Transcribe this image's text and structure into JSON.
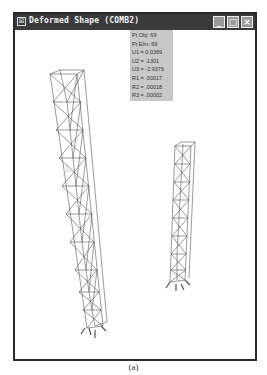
{
  "window": {
    "title": "Deformed Shape (COMB2)",
    "controls": {
      "minimize": "_",
      "maximize": "□",
      "close": "×"
    }
  },
  "point_info": {
    "lines": [
      "Pt Obj: 69",
      "Pt Elm: 69",
      "U1 = 0.0369",
      "U2 = .1301",
      "U3 = -2.9376",
      "R1 = .00017",
      "R2 = .00018",
      "R3 = .00002"
    ]
  },
  "caption": "(a)",
  "colors": {
    "titlebar": "#3a3a3a",
    "info_bg": "#c8c8c8",
    "structure": "#555555"
  }
}
